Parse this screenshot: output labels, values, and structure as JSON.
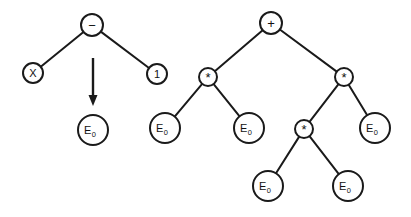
{
  "figure": {
    "background_color": "#ffffff",
    "stroke_color": "#1a1a1a",
    "width": 411,
    "height": 217
  },
  "arrow": {
    "name": "rewrite-arrow",
    "direction": "down",
    "x": 93,
    "y_start": 58,
    "y_end": 106
  },
  "trees": [
    {
      "id": "left-tree",
      "name": "source-expression-tree",
      "root_label": "−",
      "nodes": [
        {
          "id": "L0",
          "label": "−",
          "kind": "operator",
          "cx": 92,
          "cy": 25,
          "r": 11
        },
        {
          "id": "L1",
          "label": "X",
          "kind": "terminal",
          "cx": 33,
          "cy": 73,
          "r": 10
        },
        {
          "id": "L2",
          "label": "1",
          "kind": "terminal",
          "cx": 157,
          "cy": 74,
          "r": 10
        }
      ],
      "edges": [
        {
          "from": "L0",
          "to": "L1"
        },
        {
          "from": "L0",
          "to": "L2"
        }
      ]
    },
    {
      "id": "target-tree",
      "name": "rewrite-target-tree",
      "root_label": "E",
      "nodes": [
        {
          "id": "T0",
          "label": "E",
          "sub": "0",
          "kind": "nonterminal",
          "cx": 93,
          "cy": 130,
          "r": 15
        }
      ],
      "edges": []
    },
    {
      "id": "right-tree",
      "name": "result-expression-tree",
      "root_label": "+",
      "nodes": [
        {
          "id": "R0",
          "label": "+",
          "kind": "operator",
          "cx": 271,
          "cy": 23,
          "r": 11
        },
        {
          "id": "R1",
          "label": "*",
          "kind": "operator",
          "cx": 208,
          "cy": 77,
          "r": 9
        },
        {
          "id": "R2",
          "label": "*",
          "kind": "operator",
          "cx": 344,
          "cy": 77,
          "r": 9
        },
        {
          "id": "R3",
          "label": "E",
          "sub": "0",
          "kind": "nonterminal",
          "cx": 165,
          "cy": 128,
          "r": 15
        },
        {
          "id": "R4",
          "label": "E",
          "sub": "0",
          "kind": "nonterminal",
          "cx": 249,
          "cy": 128,
          "r": 15
        },
        {
          "id": "R5",
          "label": "*",
          "kind": "operator",
          "cx": 304,
          "cy": 129,
          "r": 9
        },
        {
          "id": "R6",
          "label": "E",
          "sub": "0",
          "kind": "nonterminal",
          "cx": 375,
          "cy": 128,
          "r": 15
        },
        {
          "id": "R7",
          "label": "E",
          "sub": "0",
          "kind": "nonterminal",
          "cx": 268,
          "cy": 186,
          "r": 15
        },
        {
          "id": "R8",
          "label": "E",
          "sub": "0",
          "kind": "nonterminal",
          "cx": 348,
          "cy": 186,
          "r": 15
        }
      ],
      "edges": [
        {
          "from": "R0",
          "to": "R1"
        },
        {
          "from": "R0",
          "to": "R2"
        },
        {
          "from": "R1",
          "to": "R3"
        },
        {
          "from": "R1",
          "to": "R4"
        },
        {
          "from": "R2",
          "to": "R5"
        },
        {
          "from": "R2",
          "to": "R6"
        },
        {
          "from": "R5",
          "to": "R7"
        },
        {
          "from": "R5",
          "to": "R8"
        }
      ]
    }
  ]
}
